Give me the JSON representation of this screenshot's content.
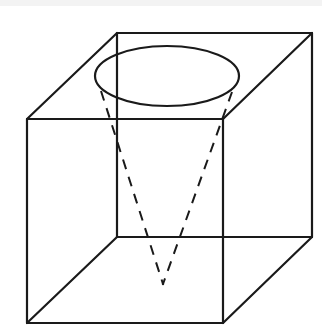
{
  "diagram": {
    "title": "",
    "colors": {
      "stroke": "#1a1a1a",
      "background": "#ffffff"
    },
    "cube": {
      "front_face": {
        "x1": 27,
        "y1": 119,
        "x2": 223,
        "y2": 323
      },
      "back_face": {
        "x1": 117,
        "y1": 33,
        "x2": 312,
        "y2": 237
      }
    },
    "cone": {
      "base_ellipse": {
        "cx": 167,
        "cy": 76,
        "rx": 72,
        "ry": 30
      },
      "apex": {
        "x": 163,
        "y": 284
      },
      "generators_style": "dashed"
    }
  }
}
